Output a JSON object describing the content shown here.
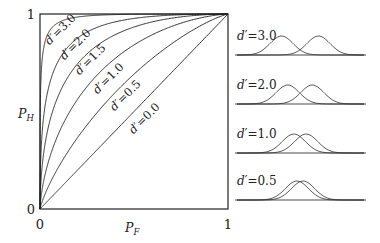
{
  "chart_data": {
    "type": "line",
    "title": "",
    "xlabel": "P_F",
    "ylabel": "P_H",
    "xlim": [
      0,
      1
    ],
    "ylim": [
      0,
      1
    ],
    "x_ticks": [
      "0",
      "1"
    ],
    "y_ticks": [
      "0",
      "1"
    ],
    "grid": false,
    "legend_position": "inline-labels",
    "model": "equal-variance Gaussian signal detection ROC: P_H = Phi(d' + Phi^-1(P_F))",
    "x": [
      0.0,
      0.1,
      0.3,
      0.5,
      0.7,
      0.9,
      1.0
    ],
    "series": [
      {
        "name": "d'=3.0",
        "d_prime": 3.0,
        "values": [
          0.0,
          0.94,
          0.992,
          0.999,
          1.0,
          1.0,
          1.0
        ]
      },
      {
        "name": "d'=2.0",
        "d_prime": 2.0,
        "values": [
          0.0,
          0.719,
          0.915,
          0.977,
          0.994,
          0.999,
          1.0
        ]
      },
      {
        "name": "d'=1.5",
        "d_prime": 1.5,
        "values": [
          0.0,
          0.558,
          0.819,
          0.933,
          0.978,
          0.996,
          1.0
        ]
      },
      {
        "name": "d'=1.0",
        "d_prime": 1.0,
        "values": [
          0.0,
          0.389,
          0.673,
          0.841,
          0.933,
          0.985,
          1.0
        ]
      },
      {
        "name": "d'=0.5",
        "d_prime": 0.5,
        "values": [
          0.0,
          0.239,
          0.495,
          0.691,
          0.841,
          0.955,
          1.0
        ]
      },
      {
        "name": "d'=0.0",
        "d_prime": 0.0,
        "values": [
          0.0,
          0.1,
          0.3,
          0.5,
          0.7,
          0.9,
          1.0
        ]
      }
    ],
    "side_panels": {
      "type": "distribution-pairs",
      "description": "Noise and signal+noise Gaussian distributions separated by d'",
      "panels": [
        {
          "label": "d'=3.0",
          "d_prime": 3.0
        },
        {
          "label": "d'=2.0",
          "d_prime": 2.0
        },
        {
          "label": "d'=1.0",
          "d_prime": 1.0
        },
        {
          "label": "d'=0.5",
          "d_prime": 0.5
        }
      ]
    }
  },
  "axes": {
    "x_label_main": "P",
    "x_label_sub": "F",
    "y_label_main": "P",
    "y_label_sub": "H",
    "x_tick_0": "0",
    "x_tick_1": "1",
    "y_tick_0": "0",
    "y_tick_1": "1"
  },
  "curve_labels": [
    {
      "text": "d′=3.0",
      "x": 63,
      "y": 32
    },
    {
      "text": "d′=2.0",
      "x": 78,
      "y": 47
    },
    {
      "text": "d′=1.5",
      "x": 93,
      "y": 62
    },
    {
      "text": "d′=1.0",
      "x": 111,
      "y": 81
    },
    {
      "text": "d′=0.5",
      "x": 128,
      "y": 98
    },
    {
      "text": "d′=0.0",
      "x": 147,
      "y": 121
    }
  ],
  "panel_labels": [
    "d′=3.0",
    "d′=2.0",
    "d′=1.0",
    "d′=0.5"
  ]
}
